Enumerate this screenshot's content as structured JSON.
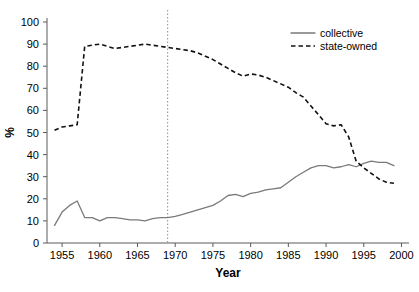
{
  "chart_data": {
    "type": "line",
    "title": "",
    "xlabel": "Year",
    "ylabel": "%",
    "xlim": [
      1953,
      2001
    ],
    "ylim": [
      0,
      100
    ],
    "xticks": [
      1955,
      1960,
      1965,
      1970,
      1975,
      1980,
      1985,
      1990,
      1995,
      2000
    ],
    "yticks": [
      0,
      10,
      20,
      30,
      40,
      50,
      60,
      70,
      80,
      90,
      100
    ],
    "grid": false,
    "legend_position": "top-right",
    "annotations": [
      {
        "name": "reference-line",
        "type": "vertical-dashed-line",
        "x": 1969
      }
    ],
    "x": [
      1954,
      1955,
      1956,
      1957,
      1958,
      1959,
      1960,
      1961,
      1962,
      1963,
      1964,
      1965,
      1966,
      1967,
      1968,
      1969,
      1970,
      1971,
      1972,
      1973,
      1974,
      1975,
      1976,
      1977,
      1978,
      1979,
      1980,
      1981,
      1982,
      1983,
      1984,
      1985,
      1986,
      1987,
      1988,
      1989,
      1990,
      1991,
      1992,
      1993,
      1994,
      1995,
      1996,
      1997,
      1998,
      1999
    ],
    "series": [
      {
        "name": "collective",
        "style": "solid",
        "color": "#7a7a7a",
        "values": [
          8,
          14,
          17,
          19,
          11.5,
          11.5,
          10,
          11.5,
          11.5,
          11,
          10.5,
          10.5,
          10,
          11,
          11.5,
          11.5,
          12,
          13,
          14,
          15,
          16,
          17,
          19,
          21.5,
          22,
          21,
          22.5,
          23,
          24,
          24.5,
          25,
          27.5,
          30,
          32,
          34,
          35,
          35,
          34,
          34.5,
          35.5,
          34.5,
          36,
          37,
          36.5,
          36.5,
          35
        ]
      },
      {
        "name": "state-owned",
        "style": "dashed",
        "color": "#111111",
        "values": [
          51,
          52.5,
          53,
          53.5,
          89,
          89.5,
          90,
          89,
          88,
          88.5,
          89,
          89.5,
          90,
          89.5,
          89,
          88.5,
          88,
          87.5,
          87,
          86,
          84.5,
          83,
          81,
          79,
          77,
          75.5,
          76.5,
          76,
          75,
          73.5,
          72,
          70.5,
          68,
          66,
          62,
          58,
          54,
          53,
          53.5,
          48,
          37,
          34,
          31.5,
          29,
          27.5,
          27
        ]
      }
    ]
  },
  "legend": {
    "items": [
      {
        "label": "collective",
        "style": "solid"
      },
      {
        "label": "state-owned",
        "style": "dashed"
      }
    ]
  },
  "axes": {
    "x_title": "Year",
    "y_title": "%"
  }
}
